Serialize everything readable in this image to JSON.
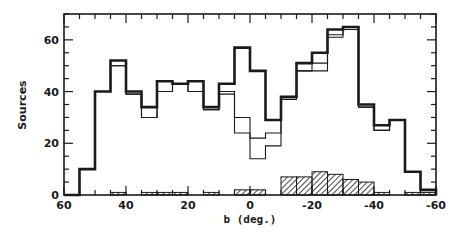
{
  "chart_data": {
    "type": "bar",
    "subtype": "step-histogram",
    "title": "",
    "xlabel": "b (deg.)",
    "ylabel": "Sources",
    "xlim": [
      60,
      -60
    ],
    "ylim": [
      0,
      70
    ],
    "x_ticks": [
      60,
      40,
      20,
      0,
      -20,
      -40,
      -60
    ],
    "x_tick_labels": [
      "60",
      "40",
      "20",
      "0",
      "-20",
      "-40",
      "-60"
    ],
    "y_ticks": [
      0,
      20,
      40,
      60
    ],
    "y_tick_labels": [
      "0",
      "20",
      "40",
      "60"
    ],
    "grid": false,
    "legend": null,
    "bin_width": 5,
    "bin_edges": [
      60,
      55,
      50,
      45,
      40,
      35,
      30,
      25,
      20,
      15,
      10,
      5,
      0,
      -5,
      -10,
      -15,
      -20,
      -25,
      -30,
      -35,
      -40,
      -45,
      -50,
      -55,
      -60
    ],
    "series": [
      {
        "name": "total (thick)",
        "style": "thick-line",
        "values": [
          0,
          10,
          40,
          52,
          40,
          34,
          44,
          43,
          44,
          34,
          43,
          57,
          48,
          29,
          38,
          51,
          55,
          64,
          65,
          35,
          27,
          29,
          9,
          2
        ]
      },
      {
        "name": "subset 1 (thin)",
        "style": "thin-line",
        "values": [
          0,
          10,
          40,
          50,
          39,
          30,
          40,
          43,
          40,
          33,
          40,
          30,
          22,
          24,
          37,
          48,
          51,
          62,
          64,
          34,
          25,
          29,
          9,
          2
        ]
      },
      {
        "name": "subset 2 (thin)",
        "style": "thin-line",
        "values": [
          0,
          10,
          40,
          50,
          39,
          30,
          40,
          43,
          40,
          33,
          39,
          24,
          14,
          19,
          37,
          48,
          48,
          61,
          64,
          34,
          25,
          29,
          9,
          2
        ]
      },
      {
        "name": "hatched",
        "style": "hatched-fill",
        "values": [
          0,
          0,
          0,
          1,
          0,
          1,
          1,
          1,
          0,
          1,
          0,
          2,
          2,
          0,
          7,
          7,
          9,
          8,
          6,
          5,
          1,
          0,
          1,
          1
        ]
      }
    ]
  },
  "colors": {
    "ink": "#1a1a1a",
    "background": "#ffffff"
  }
}
